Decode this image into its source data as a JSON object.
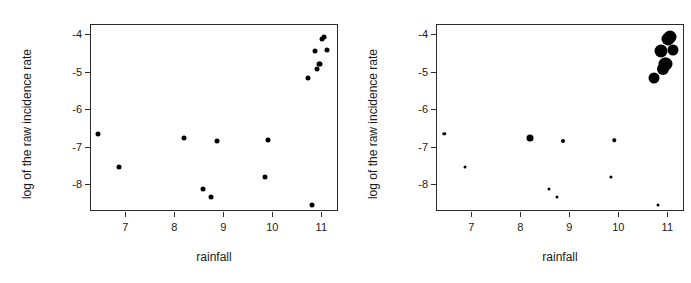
{
  "figure": {
    "panel_count": 2,
    "background_color": "#ffffff",
    "point_color": "#000000",
    "axis_color": "#2b2b2b"
  },
  "chart_data": [
    {
      "type": "scatter",
      "title": "",
      "xlabel": "rainfall",
      "ylabel": "log of the raw incidence rate",
      "xlim": [
        6.28,
        11.34
      ],
      "ylim": [
        -8.72,
        -3.72
      ],
      "xticks": [
        7,
        8,
        9,
        10,
        11
      ],
      "xticklabels": [
        "7",
        "8",
        "9",
        "10",
        "11"
      ],
      "yticks": [
        -4,
        -5,
        -6,
        -7,
        -8
      ],
      "yticklabels": [
        "-4",
        "-5",
        "-6",
        "-7",
        "-8"
      ],
      "grid": false,
      "legend": "none",
      "marker": "filled-circle",
      "marker_size_mode": "uniform",
      "x": [
        6.45,
        6.88,
        8.2,
        8.58,
        8.74,
        8.88,
        9.85,
        9.92,
        10.72,
        10.8,
        10.88,
        10.92,
        10.95,
        10.98,
        11.02,
        11.05,
        11.12
      ],
      "y": [
        -6.66,
        -7.55,
        -6.78,
        -8.13,
        -8.34,
        -6.85,
        -7.81,
        -6.83,
        -5.17,
        -8.57,
        -4.45,
        -4.93,
        -4.8,
        -4.78,
        -4.12,
        -4.06,
        -4.42
      ],
      "sizes": [
        5,
        5,
        5,
        5,
        5,
        5,
        5,
        5,
        5,
        5,
        5,
        5,
        5,
        5,
        5,
        5,
        5
      ]
    },
    {
      "type": "scatter",
      "title": "",
      "xlabel": "rainfall",
      "ylabel": "log of the raw incidence rate",
      "xlim": [
        6.28,
        11.34
      ],
      "ylim": [
        -8.72,
        -3.72
      ],
      "xticks": [
        7,
        8,
        9,
        10,
        11
      ],
      "xticklabels": [
        "7",
        "8",
        "9",
        "10",
        "11"
      ],
      "yticks": [
        -4,
        -5,
        -6,
        -7,
        -8
      ],
      "yticklabels": [
        "-4",
        "-5",
        "-6",
        "-7",
        "-8"
      ],
      "grid": false,
      "legend": "none",
      "marker": "filled-circle",
      "marker_size_mode": "proportional",
      "x": [
        6.45,
        6.88,
        8.2,
        8.58,
        8.74,
        8.88,
        9.85,
        9.92,
        10.72,
        10.8,
        10.88,
        10.92,
        10.95,
        10.98,
        11.02,
        11.05,
        11.12
      ],
      "y": [
        -6.66,
        -7.55,
        -6.78,
        -8.13,
        -8.34,
        -6.85,
        -7.81,
        -6.83,
        -5.17,
        -8.57,
        -4.45,
        -4.93,
        -4.8,
        -4.78,
        -4.12,
        -4.06,
        -4.42
      ],
      "sizes": [
        3.4,
        3.0,
        7.0,
        3.0,
        3.0,
        4.0,
        3.2,
        3.4,
        11.0,
        3.0,
        13.0,
        12.0,
        13.0,
        13.0,
        13.0,
        13.0,
        11.0
      ]
    }
  ],
  "panels": [
    {
      "id": "panel-left",
      "name": "uniform-size-scatter",
      "chart_index": 0
    },
    {
      "id": "panel-right",
      "name": "proportional-size-scatter",
      "chart_index": 1
    }
  ]
}
